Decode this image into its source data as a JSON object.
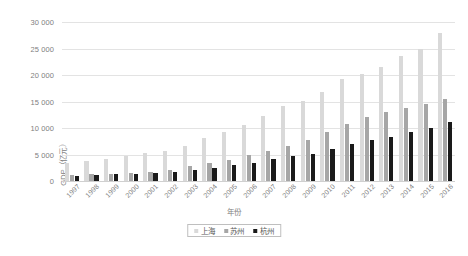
{
  "chart_data": {
    "type": "bar",
    "title": "",
    "subtitle": "",
    "xlabel": "年份",
    "ylabel": "GDP（亿元）",
    "ylim": [
      0,
      30000
    ],
    "ytick_step": 5000,
    "ytick_labels": [
      "30 000",
      "25 000",
      "20 000",
      "15 000",
      "10 000",
      "5 000",
      "0"
    ],
    "ytick_values": [
      30000,
      25000,
      20000,
      15000,
      10000,
      5000,
      0
    ],
    "grid": true,
    "legend_position": "bottom",
    "categories": [
      "1997",
      "1998",
      "1999",
      "2000",
      "2001",
      "2002",
      "2003",
      "2004",
      "2005",
      "2006",
      "2007",
      "2008",
      "2009",
      "2010",
      "2011",
      "2012",
      "2013",
      "2014",
      "2015",
      "2016"
    ],
    "series": [
      {
        "name": "上海",
        "color": "#d9d9d9",
        "values": [
          3360,
          3800,
          4200,
          4770,
          5210,
          5740,
          6690,
          8070,
          9250,
          10570,
          12190,
          14070,
          15050,
          16870,
          19200,
          20180,
          21600,
          23560,
          24960,
          27870
        ]
      },
      {
        "name": "苏州",
        "color": "#a6a6a6",
        "values": [
          1130,
          1250,
          1360,
          1540,
          1760,
          2080,
          2800,
          3450,
          4030,
          4820,
          5700,
          6700,
          7740,
          9170,
          10720,
          12010,
          13020,
          13760,
          14500,
          15470
        ]
      },
      {
        "name": "杭州",
        "color": "#1a1a1a",
        "values": [
          1010,
          1100,
          1230,
          1380,
          1570,
          1780,
          2090,
          2400,
          2940,
          3450,
          4100,
          4780,
          5100,
          5950,
          7000,
          7800,
          8350,
          9200,
          10050,
          11050
        ]
      }
    ]
  },
  "legend": {
    "items": [
      {
        "label": "上海",
        "key": "shanghai"
      },
      {
        "label": "苏州",
        "key": "suzhou"
      },
      {
        "label": "杭州",
        "key": "hangzhou"
      }
    ]
  }
}
